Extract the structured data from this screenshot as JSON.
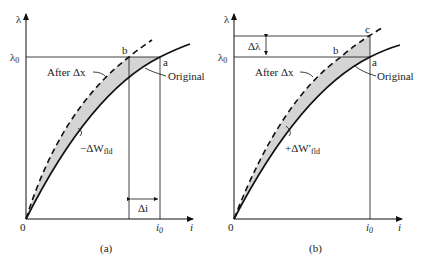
{
  "panels": [
    {
      "id": "a",
      "caption": "(a)",
      "y_axis_label": "λ",
      "x_axis_label": "i",
      "origin_label": "0",
      "lambda0_label": "λ",
      "lambda0_sub": "0",
      "i0_label": "i",
      "i0_sub": "0",
      "point_b": "b",
      "point_a": "a",
      "after_label": "After Δx",
      "original_label": "Original",
      "delta_i_label": "Δi",
      "energy_label": "−ΔW",
      "energy_sub": "fld"
    },
    {
      "id": "b",
      "caption": "(b)",
      "y_axis_label": "λ",
      "x_axis_label": "i",
      "origin_label": "0",
      "lambda0_label": "λ",
      "lambda0_sub": "0",
      "i0_label": "i",
      "i0_sub": "0",
      "point_c": "c",
      "point_b": "b",
      "point_a": "a",
      "after_label": "After Δx",
      "original_label": "Original",
      "delta_lambda_label": "Δλ",
      "energy_label": "+ΔW′",
      "energy_sub": "fld"
    }
  ],
  "colors": {
    "line": "#111111",
    "fill": "#d4d4d4"
  }
}
